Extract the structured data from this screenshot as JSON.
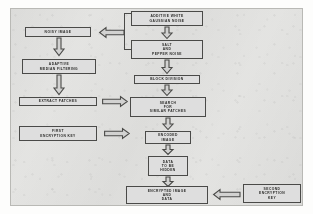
{
  "diagram": {
    "colors": {
      "panel_background": "#e8e8e6",
      "box_fill": "#dedede",
      "box_border": "#4a4a48",
      "arrow_fill": "#d2d2d1",
      "text": "#2a2a28"
    },
    "nodes": [
      {
        "id": "awgn",
        "label": "ADDITIVE WHITE\nGAUSSIAN NOISE"
      },
      {
        "id": "salt-pepper",
        "label": "SALT\nAND\nPEPPER NOISE"
      },
      {
        "id": "noisy-image",
        "label": "NOISY IMAGE"
      },
      {
        "id": "adaptive-median",
        "label": "ADAPTIVE\nMEDIAN FILTERING"
      },
      {
        "id": "extract-patches",
        "label": "EXTRACT PATCHES"
      },
      {
        "id": "first-key",
        "label": "FIRST\nENCRYPTION KEY"
      },
      {
        "id": "block-division",
        "label": "BLOCK DIVISION"
      },
      {
        "id": "search-patches",
        "label": "SEARCH\nFOR\nSIMILAR PATCHES"
      },
      {
        "id": "encoded-image",
        "label": "ENCODED\nIMAGE"
      },
      {
        "id": "data-hidden",
        "label": "DATA\nTO BE\nHIDDEN"
      },
      {
        "id": "encrypted-output",
        "label": "ENCRYPTED IMAGE\nAND\nDATA"
      },
      {
        "id": "second-key",
        "label": "SECOND\nENCRYPTION\nKEY"
      }
    ],
    "edges": [
      {
        "from": "awgn",
        "to": "salt-pepper",
        "direction": "down"
      },
      {
        "from": "salt-pepper",
        "to": "block-division",
        "direction": "down"
      },
      {
        "from": "noise-bracket",
        "to": "noisy-image",
        "direction": "left"
      },
      {
        "from": "noisy-image",
        "to": "adaptive-median",
        "direction": "down"
      },
      {
        "from": "adaptive-median",
        "to": "extract-patches",
        "direction": "down"
      },
      {
        "from": "extract-patches",
        "to": "search-patches",
        "direction": "right"
      },
      {
        "from": "block-division",
        "to": "search-patches",
        "direction": "down"
      },
      {
        "from": "search-patches",
        "to": "encoded-image",
        "direction": "down"
      },
      {
        "from": "first-key",
        "to": "encoded-image",
        "direction": "right"
      },
      {
        "from": "encoded-image",
        "to": "data-hidden",
        "direction": "down"
      },
      {
        "from": "data-hidden",
        "to": "encrypted-output",
        "direction": "down"
      },
      {
        "from": "second-key",
        "to": "encrypted-output",
        "direction": "left"
      }
    ]
  }
}
